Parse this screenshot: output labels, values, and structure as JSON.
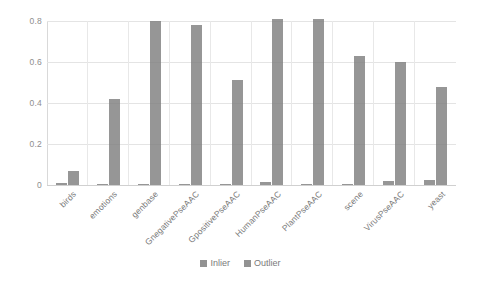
{
  "chart_data": {
    "type": "bar",
    "title": "",
    "xlabel": "",
    "ylabel": "",
    "ylim": [
      0,
      0.8
    ],
    "yticks": [
      "0",
      "0.2",
      "0.4",
      "0.6",
      "0.8"
    ],
    "ytick_values": [
      0,
      0.2,
      0.4,
      0.6,
      0.8
    ],
    "grid": true,
    "legend_position": "bottom",
    "categories": [
      "birds",
      "emotions",
      "genbase",
      "GnegativePseAAC",
      "GpositivePseAAC",
      "HumanPseAAC",
      "PlantPseAAC",
      "scene",
      "VirusPseAAC",
      "yeast"
    ],
    "series": [
      {
        "name": "Inlier",
        "color": "#7f7f7f",
        "values": [
          0.01,
          0.005,
          0.005,
          0.005,
          0.005,
          0.015,
          0.005,
          0.005,
          0.02,
          0.025
        ]
      },
      {
        "name": "Outlier",
        "color": "#7f7f7f",
        "values": [
          0.07,
          0.42,
          0.8,
          0.78,
          0.51,
          0.81,
          0.81,
          0.63,
          0.6,
          0.48
        ]
      }
    ]
  },
  "legend": {
    "items": [
      {
        "label": "Inlier"
      },
      {
        "label": "Outlier"
      }
    ]
  }
}
